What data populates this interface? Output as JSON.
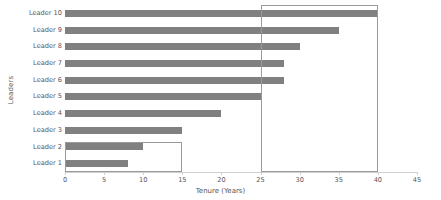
{
  "chart_data": {
    "type": "bar",
    "orientation": "horizontal",
    "title": "",
    "xlabel": "Tenure (Years)",
    "ylabel": "Leaders",
    "categories": [
      "Leader 10",
      "Leader 9",
      "Leader 8",
      "Leader 7",
      "Leader 6",
      "Leader 5",
      "Leader 4",
      "Leader 3",
      "Leader 2",
      "Leader 1"
    ],
    "values": [
      40,
      35,
      30,
      28,
      28,
      25,
      20,
      15,
      10,
      8
    ],
    "xlim": [
      0,
      45
    ],
    "xticks": [
      0,
      5,
      10,
      15,
      20,
      25,
      30,
      35,
      40,
      45
    ],
    "xtick_labels": [
      "0",
      "5",
      "10",
      "15",
      "20",
      "25",
      "30",
      "35",
      "40",
      "45"
    ],
    "grid": false,
    "legend": false,
    "bar_color": "#808080",
    "axis_color": "#d0d0d2",
    "text_color": "#55555a"
  },
  "annotations": {
    "highlight_color": "#9a9a9e",
    "rects": [
      {
        "name": "highlight-rect-upper",
        "x_start": 25,
        "x_end": 40,
        "y_top_px": 5,
        "y_bottom_px": 172
      },
      {
        "name": "highlight-rect-lower",
        "x_start": 0,
        "x_end": 15,
        "y_top_px": 142,
        "y_bottom_px": 172
      }
    ]
  }
}
